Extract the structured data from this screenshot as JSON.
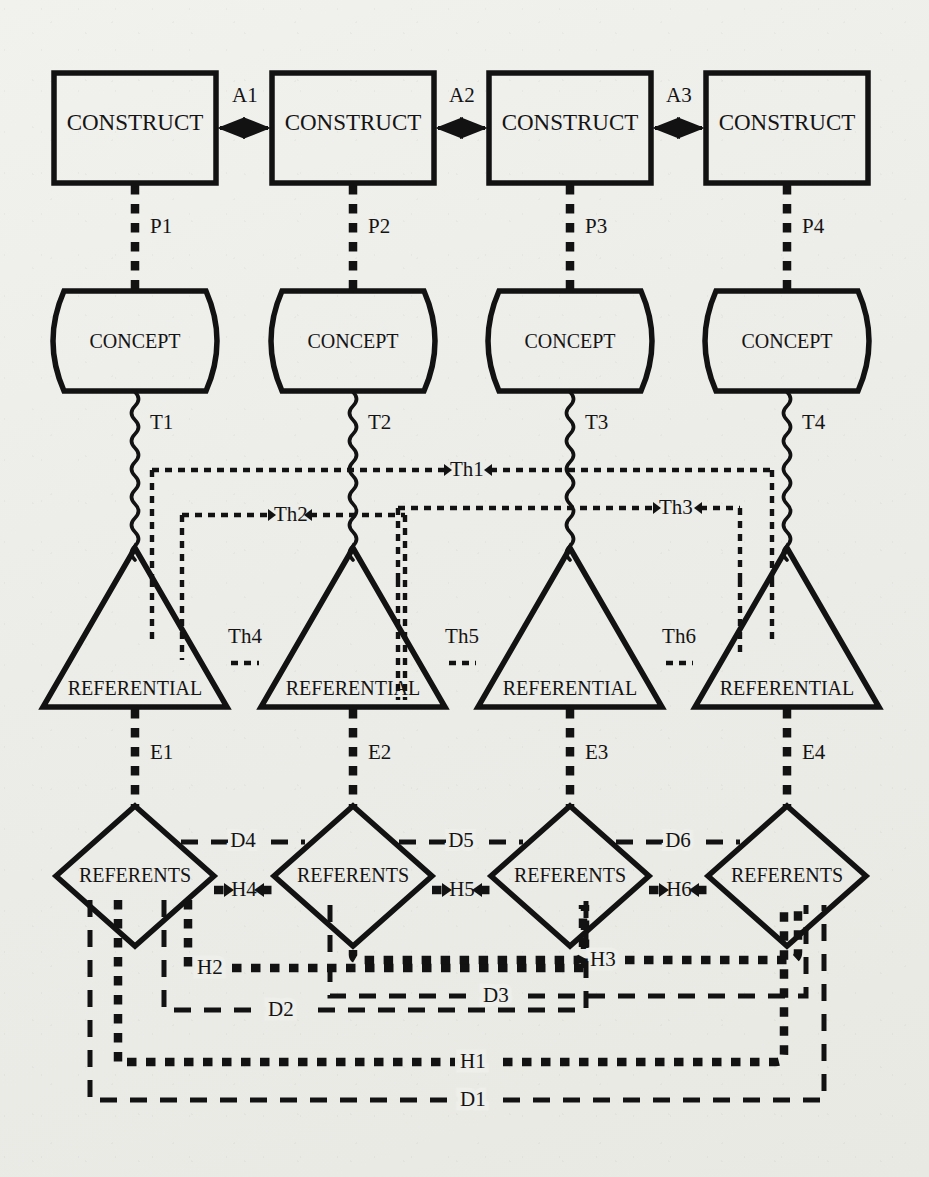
{
  "diagram": {
    "background_color": "#eeeeea",
    "ink_color": "#121212",
    "rows": [
      {
        "id": "construct-row",
        "shape": "rectangle",
        "label": "CONSTRUCT",
        "nodes": [
          "CONSTRUCT",
          "CONSTRUCT",
          "CONSTRUCT",
          "CONSTRUCT"
        ]
      },
      {
        "id": "concept-row",
        "shape": "barrel",
        "label": "CONCEPT",
        "nodes": [
          "CONCEPT",
          "CONCEPT",
          "CONCEPT",
          "CONCEPT"
        ]
      },
      {
        "id": "referential-row",
        "shape": "triangle",
        "label": "REFERENTIAL",
        "nodes": [
          "REFERENTIAL",
          "REFERENTIAL",
          "REFERENTIAL",
          "REFERENTIAL"
        ]
      },
      {
        "id": "referents-row",
        "shape": "diamond",
        "label": "REFERENTS",
        "nodes": [
          "REFERENTS",
          "REFERENTS",
          "REFERENTS",
          "REFERENTS"
        ]
      }
    ],
    "edge_labels": {
      "construct_links": [
        "A1",
        "A2",
        "A3"
      ],
      "construct_concept_links": [
        "P1",
        "P2",
        "P3",
        "P4"
      ],
      "concept_referential_links": [
        "T1",
        "T2",
        "T3",
        "T4"
      ],
      "theory_links": [
        "Th1",
        "Th2",
        "Th3",
        "Th4",
        "Th5",
        "Th6"
      ],
      "referential_referents_links": [
        "E1",
        "E2",
        "E3",
        "E4"
      ],
      "hypothesis_links": [
        "H1",
        "H2",
        "H3",
        "H4",
        "H5",
        "H6"
      ],
      "data_links": [
        "D1",
        "D2",
        "D3",
        "D4",
        "D5",
        "D6"
      ]
    },
    "line_styles": {
      "A": "solid-with-arrow",
      "P": "beaded-vertical",
      "T": "wavy-vertical",
      "Th": "dotted-chain",
      "E": "beaded-vertical",
      "H": "diamond-chain",
      "D": "dashed"
    }
  }
}
